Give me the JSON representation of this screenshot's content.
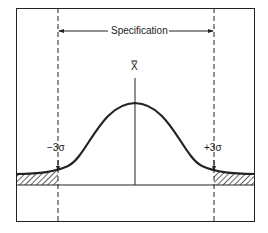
{
  "diagram": {
    "labels": {
      "specification": "Specification",
      "mean": "X̿",
      "minus": "−3σ",
      "plus": "+3σ"
    },
    "colors": {
      "ink": "#222222",
      "background": "#ffffff"
    }
  }
}
